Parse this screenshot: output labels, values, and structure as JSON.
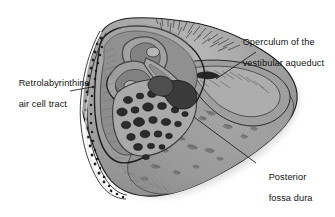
{
  "figure": {
    "type": "anatomical-illustration",
    "view": "posterior fossa surface of the petrous temporal bone",
    "background_color": "#ffffff",
    "ink_color": "#111111",
    "palette": {
      "bone_midtone": "#9a9a9a",
      "bone_light": "#c9c9c9",
      "bone_dark": "#6a6a6a",
      "air_cell_dark": "#2e2e2e",
      "outline": "#1a1a1a",
      "shadow": "#d8d8d8",
      "highlight": "#efefef"
    }
  },
  "labels": [
    {
      "id": "operculum",
      "line1": "Operculum of the",
      "line2": "vestibular aqueduct",
      "position": "top-right",
      "leader": {
        "from_x": 256,
        "from_y": 52,
        "to_x": 216,
        "to_y": 79
      }
    },
    {
      "id": "retrolabyrinthine",
      "line1": "Retrolabyrinthine",
      "line2": "air cell tract",
      "position": "left",
      "leader": {
        "from_x": 70,
        "from_y": 91,
        "to_x": 92,
        "to_y": 87
      }
    },
    {
      "id": "posterior-fossa-dura",
      "line1": "Posterior",
      "line2": "fossa dura",
      "position": "bottom-right",
      "leader": {
        "from_x": 256,
        "from_y": 163,
        "to_x": 194,
        "to_y": 117
      }
    }
  ],
  "structures": [
    {
      "name": "retrolabyrinthine-air-cell-tract",
      "description": "stippled band of small dark air cells along the anterior-left rim"
    },
    {
      "name": "labyrinth-semicircular-canals",
      "description": "looping tubular canal profiles in the upper central region"
    },
    {
      "name": "vestibular-aqueduct-operculum",
      "description": "slit-like opening at the posterior petrous ridge"
    },
    {
      "name": "mastoid-air-cells",
      "description": "cluster of dark rounded cells in the central-lower field"
    },
    {
      "name": "posterior-fossa-dura",
      "description": "broad hatched dural surface filling the right and lower field"
    },
    {
      "name": "petrous-ridge-hair-strokes",
      "description": "fine brush strokes along the superior margin"
    }
  ]
}
